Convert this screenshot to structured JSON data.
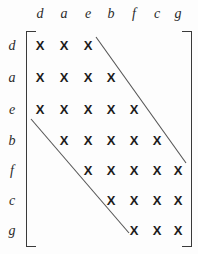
{
  "figure": {
    "kind": "banded-adjacency-matrix",
    "background_color": "#fdfdfd",
    "ink_color": "#1c1c1c",
    "bracket_color": "#3a3a3a",
    "diagonal_color": "#555555",
    "mark_glyph": "X"
  },
  "matrix": {
    "size": 7,
    "column_labels": [
      "d",
      "a",
      "e",
      "b",
      "f",
      "c",
      "g"
    ],
    "row_labels": [
      "d",
      "a",
      "e",
      "b",
      "f",
      "c",
      "g"
    ],
    "column_x": [
      40,
      64,
      88,
      111,
      134,
      157,
      178
    ],
    "row_y": [
      46,
      78,
      110,
      141,
      171,
      201,
      231
    ],
    "header_y": 14,
    "label_x": 12,
    "rows": [
      {
        "label": "d",
        "marks": [
          1,
          1,
          1,
          0,
          0,
          0,
          0
        ]
      },
      {
        "label": "a",
        "marks": [
          1,
          1,
          1,
          1,
          0,
          0,
          0
        ]
      },
      {
        "label": "e",
        "marks": [
          1,
          1,
          1,
          1,
          1,
          0,
          0
        ]
      },
      {
        "label": "b",
        "marks": [
          0,
          1,
          1,
          1,
          1,
          1,
          0
        ]
      },
      {
        "label": "f",
        "marks": [
          0,
          0,
          1,
          1,
          1,
          1,
          1
        ]
      },
      {
        "label": "c",
        "marks": [
          0,
          0,
          0,
          1,
          1,
          1,
          1
        ]
      },
      {
        "label": "g",
        "marks": [
          0,
          0,
          0,
          0,
          1,
          1,
          1
        ]
      }
    ]
  },
  "diagonals": [
    {
      "name": "upper-bandwidth-line",
      "x1": 96,
      "y1": 37,
      "x2": 186,
      "y2": 163
    },
    {
      "name": "lower-bandwidth-line",
      "x1": 31,
      "y1": 119,
      "x2": 129,
      "y2": 233
    }
  ]
}
